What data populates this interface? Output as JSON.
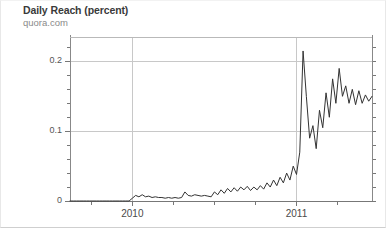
{
  "chart_title": "Daily Reach (percent)",
  "chart_subtitle": "quora.com",
  "chart_data": {
    "type": "line",
    "title": "Daily Reach (percent)",
    "subtitle": "quora.com",
    "xlabel": "",
    "ylabel": "",
    "grid": true,
    "legend": false,
    "line_color": "#333333",
    "grid_color": "#c8c8c8",
    "axis_color": "#888888",
    "xlim": [
      "2009-08",
      "2011-05"
    ],
    "ylim": [
      0,
      0.235
    ],
    "ytick_labels": [
      "0",
      "0.1",
      "0.2"
    ],
    "ytick_values": [
      0,
      0.1,
      0.2
    ],
    "yminor_count": 4,
    "xtick_labels": [
      "2010",
      "2011"
    ],
    "xtick_values": [
      2010.0,
      2011.0
    ],
    "x": [
      2009.62,
      2009.64,
      2009.66,
      2009.68,
      2009.7,
      2009.72,
      2009.74,
      2009.76,
      2009.78,
      2009.8,
      2009.82,
      2009.84,
      2009.86,
      2009.88,
      2009.9,
      2009.92,
      2009.94,
      2009.96,
      2009.98,
      2010.0,
      2010.02,
      2010.04,
      2010.06,
      2010.08,
      2010.1,
      2010.12,
      2010.14,
      2010.16,
      2010.18,
      2010.2,
      2010.22,
      2010.24,
      2010.26,
      2010.28,
      2010.3,
      2010.32,
      2010.34,
      2010.36,
      2010.38,
      2010.4,
      2010.42,
      2010.44,
      2010.46,
      2010.48,
      2010.5,
      2010.52,
      2010.54,
      2010.56,
      2010.58,
      2010.6,
      2010.62,
      2010.64,
      2010.66,
      2010.68,
      2010.7,
      2010.72,
      2010.74,
      2010.76,
      2010.78,
      2010.8,
      2010.82,
      2010.84,
      2010.86,
      2010.88,
      2010.9,
      2010.92,
      2010.94,
      2010.96,
      2010.98,
      2011.0,
      2011.02,
      2011.04,
      2011.06,
      2011.08,
      2011.1,
      2011.12,
      2011.14,
      2011.16,
      2011.18,
      2011.2,
      2011.22,
      2011.24,
      2011.26,
      2011.28,
      2011.3,
      2011.32,
      2011.34,
      2011.36,
      2011.38,
      2011.4,
      2011.42,
      2011.44,
      2011.46
    ],
    "values": [
      0.0,
      0.0,
      0.0,
      0.0,
      0.0,
      0.0,
      0.0,
      0.0,
      0.0,
      0.0,
      0.0,
      0.0,
      0.0,
      0.0,
      0.0,
      0.0,
      0.0,
      0.0,
      0.0,
      0.004,
      0.008,
      0.006,
      0.009,
      0.006,
      0.007,
      0.005,
      0.006,
      0.005,
      0.005,
      0.004,
      0.005,
      0.004,
      0.005,
      0.004,
      0.005,
      0.013,
      0.008,
      0.007,
      0.009,
      0.008,
      0.007,
      0.008,
      0.007,
      0.006,
      0.013,
      0.009,
      0.016,
      0.011,
      0.018,
      0.013,
      0.019,
      0.014,
      0.02,
      0.016,
      0.021,
      0.015,
      0.02,
      0.016,
      0.022,
      0.017,
      0.026,
      0.02,
      0.03,
      0.022,
      0.034,
      0.026,
      0.04,
      0.03,
      0.05,
      0.038,
      0.07,
      0.215,
      0.15,
      0.09,
      0.108,
      0.075,
      0.13,
      0.105,
      0.155,
      0.12,
      0.175,
      0.14,
      0.19,
      0.15,
      0.165,
      0.14,
      0.16,
      0.138,
      0.158,
      0.14,
      0.152,
      0.143,
      0.15
    ]
  },
  "plot_geometry": {
    "left": 69,
    "right": 371,
    "top": 36,
    "bottom": 200
  }
}
